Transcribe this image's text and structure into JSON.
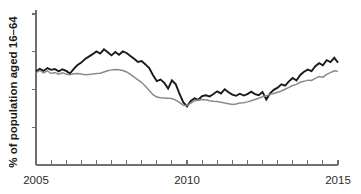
{
  "chart_data": {
    "type": "line",
    "title": "",
    "subtitle": "",
    "xlabel": "",
    "ylabel": "% of population aged 16–64",
    "xlim": [
      2005,
      2015
    ],
    "ylim": [
      0,
      100
    ],
    "grid": false,
    "legend_position": "none",
    "x_tick_labels": [
      "2005",
      "2010",
      "2015"
    ],
    "x_tick_label_values": [
      2005,
      2010,
      2015
    ],
    "x_minor_tick_values": [
      2005,
      2005.5,
      2006,
      2006.5,
      2007,
      2007.5,
      2008,
      2008.5,
      2009,
      2009.5,
      2010,
      2010.5,
      2011,
      2011.5,
      2012,
      2012.5,
      2013,
      2013.5,
      2014,
      2014.5,
      2015
    ],
    "y_tick_values": [
      25,
      50,
      75,
      100
    ],
    "y_tick_labels": [
      "",
      "",
      "",
      ""
    ],
    "axis_colors": {
      "axis": "#6e6e6e",
      "text": "#2b2b2b"
    },
    "series": [
      {
        "name": "series-dark",
        "color": "#1a1a1a",
        "width": 1.9,
        "x": [
          2005.0,
          2005.125,
          2005.25,
          2005.375,
          2005.5,
          2005.625,
          2005.75,
          2005.875,
          2006.0,
          2006.125,
          2006.25,
          2006.375,
          2006.5,
          2006.625,
          2006.75,
          2006.875,
          2007.0,
          2007.125,
          2007.25,
          2007.375,
          2007.5,
          2007.625,
          2007.75,
          2007.875,
          2008.0,
          2008.125,
          2008.25,
          2008.375,
          2008.5,
          2008.625,
          2008.75,
          2008.875,
          2009.0,
          2009.125,
          2009.25,
          2009.375,
          2009.5,
          2009.625,
          2009.75,
          2009.875,
          2010.0,
          2010.125,
          2010.25,
          2010.375,
          2010.5,
          2010.625,
          2010.75,
          2010.875,
          2011.0,
          2011.125,
          2011.25,
          2011.375,
          2011.5,
          2011.625,
          2011.75,
          2011.875,
          2012.0,
          2012.125,
          2012.25,
          2012.375,
          2012.5,
          2012.625,
          2012.75,
          2012.875,
          2013.0,
          2013.125,
          2013.25,
          2013.375,
          2013.5,
          2013.625,
          2013.75,
          2013.875,
          2014.0,
          2014.125,
          2014.25,
          2014.375,
          2014.5,
          2014.625,
          2014.75,
          2014.875,
          2015.0
        ],
        "values": [
          62.0,
          63.6,
          62.3,
          64.2,
          63.0,
          63.6,
          62.0,
          63.4,
          62.3,
          60.6,
          63.6,
          66.2,
          67.8,
          70.2,
          71.8,
          73.4,
          75.2,
          73.8,
          76.6,
          74.6,
          72.6,
          74.8,
          73.0,
          75.2,
          74.2,
          72.2,
          70.4,
          68.3,
          68.8,
          66.6,
          64.2,
          59.4,
          55.6,
          56.6,
          54.4,
          50.6,
          56.0,
          53.6,
          47.2,
          41.6,
          38.8,
          42.4,
          44.2,
          43.2,
          45.6,
          46.2,
          45.4,
          47.0,
          48.8,
          47.4,
          50.2,
          48.2,
          46.6,
          45.8,
          47.2,
          46.0,
          47.0,
          48.6,
          47.0,
          46.2,
          48.4,
          43.4,
          47.4,
          49.8,
          51.2,
          53.4,
          52.6,
          55.4,
          57.6,
          56.0,
          59.6,
          61.8,
          63.2,
          62.2,
          65.4,
          67.4,
          66.0,
          69.4,
          68.2,
          71.0,
          67.8
        ]
      },
      {
        "name": "series-gray",
        "color": "#8a8a8a",
        "width": 1.5,
        "x": [
          2005.0,
          2005.125,
          2005.25,
          2005.375,
          2005.5,
          2005.625,
          2005.75,
          2005.875,
          2006.0,
          2006.125,
          2006.25,
          2006.375,
          2006.5,
          2006.625,
          2006.75,
          2006.875,
          2007.0,
          2007.125,
          2007.25,
          2007.375,
          2007.5,
          2007.625,
          2007.75,
          2007.875,
          2008.0,
          2008.125,
          2008.25,
          2008.375,
          2008.5,
          2008.625,
          2008.75,
          2008.875,
          2009.0,
          2009.125,
          2009.25,
          2009.375,
          2009.5,
          2009.625,
          2009.75,
          2009.875,
          2010.0,
          2010.125,
          2010.25,
          2010.375,
          2010.5,
          2010.625,
          2010.75,
          2010.875,
          2011.0,
          2011.125,
          2011.25,
          2011.375,
          2011.5,
          2011.625,
          2011.75,
          2011.875,
          2012.0,
          2012.125,
          2012.25,
          2012.375,
          2012.5,
          2012.625,
          2012.75,
          2012.875,
          2013.0,
          2013.125,
          2013.25,
          2013.375,
          2013.5,
          2013.625,
          2013.75,
          2013.875,
          2014.0,
          2014.125,
          2014.25,
          2014.375,
          2014.5,
          2014.625,
          2014.75,
          2014.875,
          2015.0
        ],
        "values": [
          61.0,
          62.6,
          61.0,
          62.4,
          60.6,
          61.2,
          60.2,
          61.0,
          60.2,
          59.8,
          60.4,
          60.6,
          60.2,
          59.8,
          60.0,
          60.2,
          60.6,
          60.8,
          61.6,
          62.4,
          63.0,
          63.2,
          63.0,
          62.6,
          61.6,
          60.0,
          58.2,
          56.4,
          54.6,
          52.2,
          49.4,
          46.6,
          45.0,
          44.6,
          44.4,
          44.2,
          44.0,
          43.0,
          41.4,
          39.6,
          39.4,
          41.0,
          42.6,
          43.0,
          43.4,
          43.2,
          42.6,
          42.2,
          42.0,
          41.6,
          41.0,
          40.6,
          40.0,
          40.4,
          41.0,
          41.2,
          41.8,
          42.6,
          43.4,
          44.2,
          45.2,
          45.8,
          46.8,
          47.4,
          48.2,
          49.0,
          50.2,
          51.4,
          52.6,
          53.4,
          54.8,
          55.4,
          56.2,
          56.0,
          57.4,
          58.6,
          58.2,
          60.0,
          61.2,
          62.4,
          62.0
        ]
      }
    ]
  }
}
